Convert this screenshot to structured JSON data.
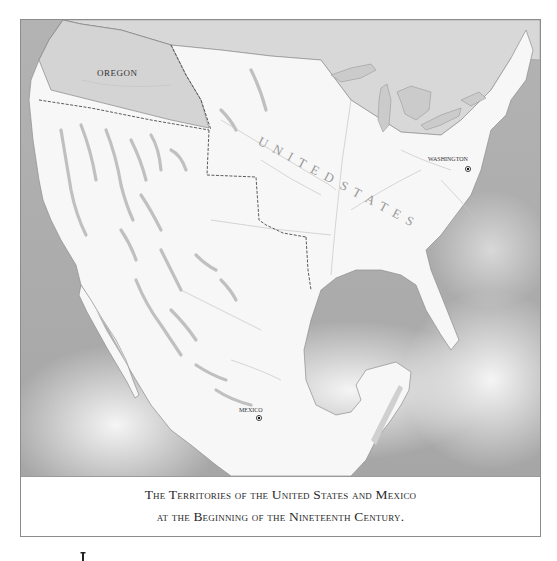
{
  "map": {
    "title_line_1": "The Territories of the United States and Mexico",
    "title_line_2": "at the Beginning of the Nineteenth Century.",
    "labels": {
      "oregon": "OREGON",
      "united_states": "UNITED STATES",
      "washington": "WASHINGTON",
      "mexico_city": "MEXICO"
    },
    "colors": {
      "ocean": "#a9a9a9",
      "ocean_light": "#efefef",
      "land": "#f6f6f6",
      "oregon_territory": "#d3d3d3",
      "canada": "#d6d6d6",
      "lakes": "#c9c9c9",
      "mountains": "#bdbdbd",
      "rivers": "#c8c8c8",
      "border": "#555555"
    },
    "capitals": [
      {
        "name": "WASHINGTON",
        "marker": "dot-in-circle"
      },
      {
        "name": "MEXICO",
        "marker": "dot-in-circle"
      }
    ]
  },
  "stray_mark": "I"
}
